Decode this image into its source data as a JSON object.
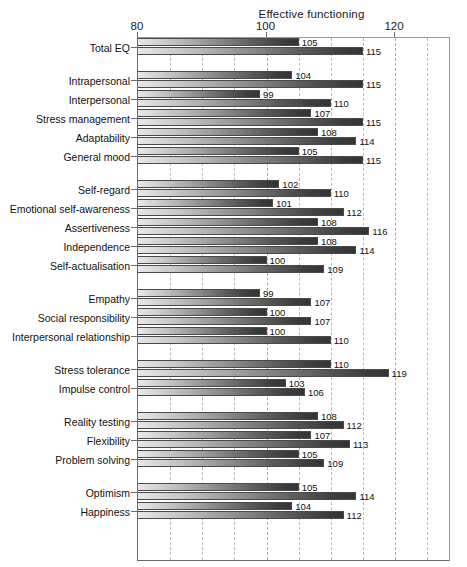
{
  "chart_data": {
    "type": "bar",
    "orientation": "horizontal",
    "title": "Effective functioning",
    "xlabel": "",
    "ylabel": "",
    "xlim": [
      80,
      130
    ],
    "xticks": [
      80,
      100,
      120
    ],
    "xtick_labels": [
      "80",
      "100",
      "120"
    ],
    "gridlines": [
      85,
      90,
      95,
      100,
      105,
      110,
      115,
      120,
      125
    ],
    "grid": true,
    "legend": "none",
    "series": [
      {
        "name": "upper",
        "values": [
          105,
          104,
          99,
          107,
          108,
          105,
          102,
          101,
          108,
          108,
          100,
          99,
          100,
          100,
          110,
          103,
          108,
          107,
          105,
          105,
          104
        ]
      },
      {
        "name": "lower",
        "values": [
          115,
          115,
          110,
          115,
          114,
          115,
          110,
          112,
          116,
          114,
          109,
          107,
          107,
          110,
          119,
          106,
          112,
          113,
          109,
          114,
          112
        ]
      }
    ],
    "categories": [
      "Total EQ",
      "Intrapersonal",
      "Interpersonal",
      "Stress management",
      "Adaptability",
      "General mood",
      "Self-regard",
      "Emotional self-awareness",
      "Assertiveness",
      "Independence",
      "Self-actualisation",
      "Empathy",
      "Social responsibility",
      "Interpersonal relationship",
      "Stress tolerance",
      "Impulse control",
      "Reality testing",
      "Flexibility",
      "Problem solving",
      "Optimism",
      "Happiness"
    ],
    "groups": [
      {
        "rows": [
          0
        ]
      },
      {
        "rows": [
          1,
          2,
          3,
          4,
          5
        ]
      },
      {
        "rows": [
          6,
          7,
          8,
          9,
          10
        ]
      },
      {
        "rows": [
          11,
          12,
          13
        ]
      },
      {
        "rows": [
          14,
          15
        ]
      },
      {
        "rows": [
          16,
          17,
          18
        ]
      },
      {
        "rows": [
          19,
          20
        ]
      }
    ],
    "colors": {
      "bar_light": "#e8e8e8",
      "bar_dark": "#343434",
      "bar_border": "#4a4a4a",
      "gridline": "#b9b9b9",
      "axis": "#6b6b6b",
      "text": "#111111",
      "background": "#ffffff"
    }
  }
}
